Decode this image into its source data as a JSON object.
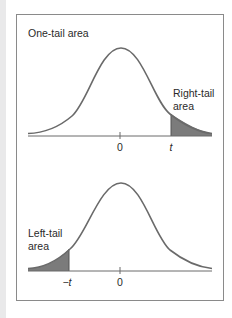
{
  "top_panel": {
    "title": "One-tail area",
    "tail_label_line1": "Right-tail",
    "tail_label_line2": "area",
    "tick_center": "0",
    "tick_t": "t"
  },
  "bottom_panel": {
    "tail_label_line1": "Left-tail",
    "tail_label_line2": "area",
    "tick_neg_t": "−t",
    "tick_center": "0"
  },
  "colors": {
    "curve": "#6a6a6a",
    "axis": "#6a6a6a",
    "shade": "#7b7b7b",
    "frame": "#8a8a8a",
    "text": "#2a2a2a"
  }
}
